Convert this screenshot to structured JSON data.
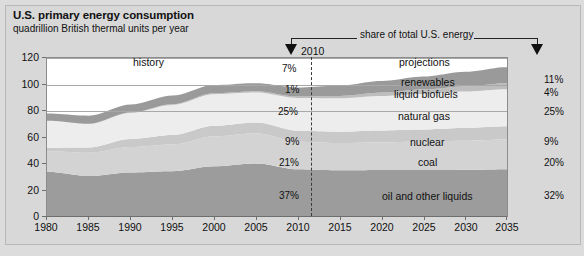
{
  "header": {
    "title": "U.S. primary energy consumption",
    "subtitle": "quadrillion British thermal units per year"
  },
  "annotations": {
    "share_label": "share of total U.S. energy",
    "history_label": "history",
    "projections_label": "projections",
    "year_marker": "2010",
    "left_arrow_icon": "down-arrow-icon",
    "right_arrow_icon": "down-arrow-icon",
    "divider_icon": "vertical-dashed-line-icon"
  },
  "colors": {
    "background": "#dcdcdc",
    "plot_background": "#ffffff",
    "renewables": "#9a9a9a",
    "liquid_biofuels": "#bdbdbd",
    "natural_gas": "#ededed",
    "nuclear": "#c9c9c9",
    "coal": "#d3d3d3",
    "oil_and_other_liquids": "#9c9c9c",
    "axis": "#6e6e6e",
    "gridline": "#a8a8a8"
  },
  "chart_data": {
    "type": "area",
    "title": "U.S. primary energy consumption",
    "subtitle": "quadrillion British thermal units per year",
    "xlabel": "",
    "ylabel": "quadrillion British thermal units per year",
    "xlim": [
      1980,
      2035
    ],
    "ylim": [
      0,
      120
    ],
    "yticks": [
      0,
      20,
      40,
      60,
      80,
      100,
      120
    ],
    "xticks": [
      1980,
      1985,
      1990,
      1995,
      2000,
      2005,
      2010,
      2015,
      2020,
      2025,
      2030,
      2035
    ],
    "grid": true,
    "legend": "inline-labels",
    "stacked": true,
    "history_projection_split": 2010,
    "x": [
      1980,
      1985,
      1990,
      1995,
      2000,
      2005,
      2010,
      2015,
      2020,
      2025,
      2030,
      2035
    ],
    "series": [
      {
        "name": "oil and other liquids",
        "color": "#9c9c9c",
        "values": [
          34.2,
          30.9,
          33.6,
          34.6,
          38.3,
          40.4,
          36.0,
          35.3,
          35.4,
          35.4,
          35.6,
          36.0
        ],
        "share_2010": "37%",
        "share_2035": "32%"
      },
      {
        "name": "coal",
        "color": "#d3d3d3",
        "values": [
          15.4,
          17.5,
          19.2,
          20.1,
          22.6,
          22.8,
          20.8,
          20.5,
          21.0,
          21.5,
          22.0,
          22.5
        ],
        "share_2010": "21%",
        "share_2035": "20%"
      },
      {
        "name": "nuclear",
        "color": "#c9c9c9",
        "values": [
          2.7,
          4.1,
          6.1,
          7.2,
          7.9,
          8.2,
          8.4,
          8.6,
          8.9,
          9.2,
          9.6,
          10.0
        ],
        "share_2010": "9%",
        "share_2035": "9%"
      },
      {
        "name": "natural gas",
        "color": "#ededed",
        "values": [
          20.4,
          17.7,
          19.7,
          22.7,
          23.9,
          22.6,
          24.6,
          25.2,
          26.0,
          26.8,
          27.5,
          28.0
        ],
        "share_2010": "25%",
        "share_2035": "25%"
      },
      {
        "name": "liquid biofuels",
        "color": "#bdbdbd",
        "values": [
          0.0,
          0.2,
          0.3,
          0.5,
          0.8,
          0.9,
          1.1,
          1.8,
          2.6,
          3.3,
          3.9,
          4.4
        ],
        "share_2010": "1%",
        "share_2035": "4%"
      },
      {
        "name": "renewables",
        "color": "#9a9a9a",
        "values": [
          5.4,
          6.1,
          6.0,
          6.6,
          6.1,
          6.1,
          6.8,
          7.8,
          8.8,
          9.8,
          11.0,
          12.2
        ],
        "share_2010": "7%",
        "share_2035": "11%"
      }
    ],
    "totals": [
      78.1,
      76.5,
      84.9,
      91.7,
      99.6,
      101.0,
      97.7,
      99.2,
      102.7,
      106.0,
      109.6,
      113.1
    ]
  },
  "axis": {
    "y_labels": [
      "120",
      "100",
      "80",
      "60",
      "40",
      "20",
      "0"
    ],
    "x_labels": [
      "1980",
      "1985",
      "1990",
      "1995",
      "2000",
      "2005",
      "2010",
      "2015",
      "2020",
      "2025",
      "2030",
      "2035"
    ]
  },
  "band_labels": [
    {
      "name": "renewables",
      "text": "renewables"
    },
    {
      "name": "liquid-biofuels",
      "text": "liquid biofuels"
    },
    {
      "name": "natural-gas",
      "text": "natural gas"
    },
    {
      "name": "nuclear",
      "text": "nuclear"
    },
    {
      "name": "coal",
      "text": "coal"
    },
    {
      "name": "oil-and-other-liquids",
      "text": "oil and other liquids"
    }
  ],
  "shares_2010": [
    "7%",
    "1%",
    "25%",
    "9%",
    "21%",
    "37%"
  ],
  "shares_2035": [
    "11%",
    "4%",
    "25%",
    "9%",
    "20%",
    "32%"
  ]
}
